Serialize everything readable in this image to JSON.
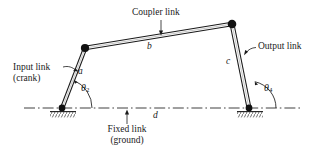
{
  "figure": {
    "colors": {
      "line": "#1a1a1a",
      "joint": "#111111",
      "background": "#ffffff",
      "hatch": "#555555"
    },
    "labels": {
      "coupler_link": "Coupler link",
      "input_link_line1": "Input link",
      "input_link_line2": "(crank)",
      "output_link": "Output link",
      "fixed_link_line1": "Fixed link",
      "fixed_link_line2": "(ground)",
      "link_a": "a",
      "link_b": "b",
      "link_c": "c",
      "link_d": "d",
      "theta2": "θ",
      "theta2_sub": "2",
      "theta4": "θ",
      "theta4_sub": "4"
    },
    "geometry": {
      "pivot_left": [
        62,
        108
      ],
      "pivot_right": [
        249,
        108
      ],
      "joint_top_left": [
        85,
        48
      ],
      "joint_top_right": [
        232,
        24
      ],
      "ground_line_y": 108,
      "ground_line_x_start": 24,
      "ground_line_x_end": 302
    }
  }
}
